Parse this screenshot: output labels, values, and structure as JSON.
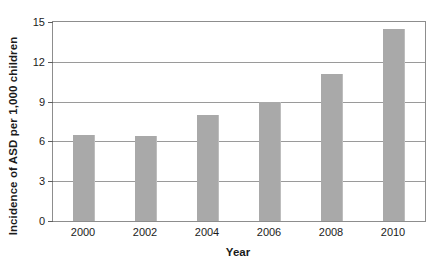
{
  "chart_data": {
    "type": "bar",
    "title": "",
    "xlabel": "Year",
    "ylabel": "Incidence of ASD per 1,000 children",
    "categories": [
      "2000",
      "2002",
      "2004",
      "2006",
      "2008",
      "2010"
    ],
    "values": [
      6.5,
      6.4,
      8.0,
      9.0,
      11.1,
      14.5
    ],
    "ylim": [
      0,
      15
    ],
    "yticks": [
      "0",
      "3",
      "6",
      "9",
      "12",
      "15"
    ],
    "ytick_values": [
      0,
      3,
      6,
      9,
      12,
      15
    ],
    "grid": true,
    "legend": "none",
    "bar_color": "#a9a9a9",
    "axis_color": "#8d8d8d",
    "text_color": "#1b1b1b"
  }
}
